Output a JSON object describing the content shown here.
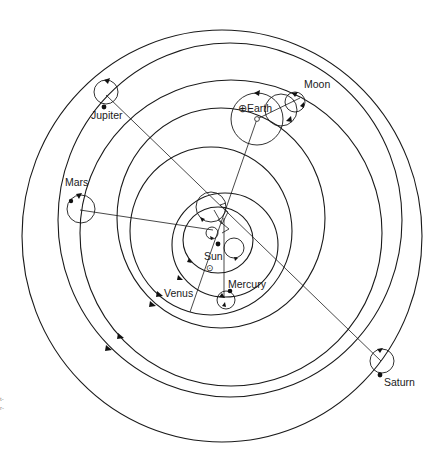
{
  "figure": {
    "labels": {
      "jupiter": "Jupiter",
      "moon": "Moon",
      "earth": "Earth",
      "earth_symbol": "⊕",
      "mars": "Mars",
      "sun": "Sun",
      "sun_symbol": "⊙",
      "venus": "Venus",
      "mercury": "Mercury",
      "saturn": "Saturn"
    },
    "edge_marks": [
      "t-",
      "r-"
    ],
    "colors": {
      "stroke": "#1a1a1a",
      "background": "#ffffff"
    }
  }
}
